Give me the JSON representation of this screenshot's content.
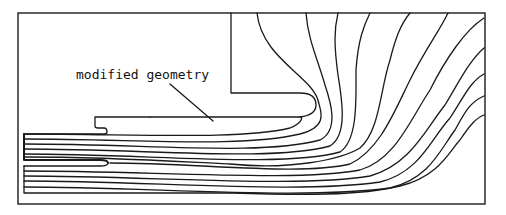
{
  "figure": {
    "label": "modified geometry",
    "colors": {
      "line": "#1a1a1a",
      "background": "#ffffff"
    },
    "frame": {
      "x": 18,
      "y": 13,
      "width": 467,
      "height": 191
    },
    "electrodes": {
      "upper_electrode": "M 231 13 L 231 93 L 300 93 Q 316 93 316 105 Q 316 115 300 117 L 150 117",
      "lower_plate_with_notch": "M 95 117 L 150 117 M 95 117 L 95 126 Q 95 128 98 128 L 104 128 Q 107 128 107 132 Q 107 134 104 134 L 24 134",
      "inner_rod_upper": "M 24 134 L 24 160 L 100 160 Q 108 160 108 163",
      "inner_rod_lower": "M 24 166 L 100 166 Q 108 166 108 163",
      "bottom_plate": "M 24 166 L 24 193 L 230 193"
    },
    "pointer": "M 170 84 L 213 121",
    "field_lines": [
      "M 24 139 C 140 139 240 148 300 134 C 330 126 320 110 318 100 C 310 75 262 58 257 13",
      "M 24 144 C 150 144 260 156 320 140 C 340 130 330 100 325 85 C 318 60 308 40 306 13",
      "M 24 149 C 150 149 270 162 330 146 C 348 135 342 100 338 75 C 334 45 334 30 338 13",
      "M 24 154 C 150 154 280 168 340 152 C 358 140 356 100 356 70 C 358 40 364 25 370 13",
      "M 24 157 C 120 157 200 163 230 164 C 290 170 340 160 360 148 C 380 130 380 90 390 60 C 395 40 400 25 410 13",
      "M 110 163 C 200 163 300 176 350 164 C 380 150 395 110 410 80 C 425 50 440 30 448 13",
      "M 24 171 C 150 171 300 182 360 170 C 395 160 410 120 430 90 C 445 60 465 30 484 18",
      "M 24 176 C 150 176 300 188 370 176 C 410 165 425 130 445 105 C 460 80 470 60 484 48",
      "M 24 181 C 150 181 300 194 380 182 C 420 172 430 140 450 118 C 465 95 470 82 484 74",
      "M 24 187 C 150 187 300 200 390 188 C 430 178 440 150 455 130 C 465 112 470 102 484 96",
      "M 24 134 C 140 134 240 140 290 128 C 305 122 302 115 300 117",
      "M 230 193 C 300 195 360 196 400 186 C 440 176 450 150 460 140 C 470 125 476 118 484 115"
    ]
  }
}
